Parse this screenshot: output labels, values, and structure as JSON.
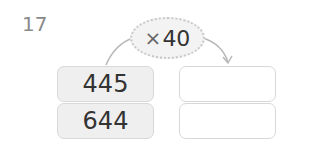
{
  "problem": {
    "number": "17",
    "operation": {
      "symbol": "×",
      "operand": "40"
    },
    "rows": [
      {
        "input": "445",
        "output": ""
      },
      {
        "input": "644",
        "output": ""
      }
    ]
  }
}
